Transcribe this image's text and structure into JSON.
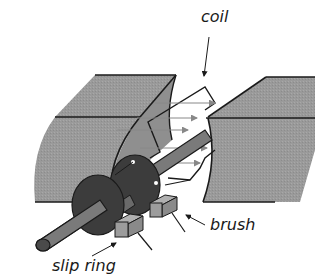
{
  "diagram": {
    "type": "ac-generator",
    "labels": {
      "coil": "coil",
      "brush": "brush",
      "slip_ring": "slip ring"
    },
    "colors": {
      "magnet_pole": "#9a9a9a",
      "magnet_pole_face": "#8f8f8f",
      "outline": "#1a1a1a",
      "shaft": "#7a7a7a",
      "shaft_dark": "#4a4a4a",
      "slip_ring": "#3c3c3c",
      "brush": "#9c9c9c",
      "field_line": "#888888",
      "coil_fill": "#ffffff",
      "background": "#ffffff"
    },
    "field_arrows_count": 5
  }
}
